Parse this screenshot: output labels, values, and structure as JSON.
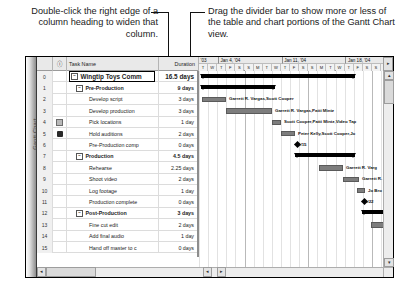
{
  "callouts": {
    "left": "Double-click the right edge of a column heading to widen that column.",
    "right": "Drag the divider bar to show more or less of the table and chart portions of the Gantt Chart view."
  },
  "view": {
    "name": "Gantt Chart"
  },
  "table": {
    "headers": {
      "id": "",
      "indicator": "ⓘ",
      "task_name": "Task Name",
      "duration": "Duration"
    },
    "rows": [
      {
        "id": "0",
        "indicator": "",
        "name": "Wingtip Toys Comm",
        "duration": "16.5 days",
        "level": 0,
        "expander": "−",
        "selected": true
      },
      {
        "id": "1",
        "indicator": "",
        "name": "Pre-Production",
        "duration": "9 days",
        "level": 1,
        "expander": "−",
        "selected": false
      },
      {
        "id": "2",
        "indicator": "",
        "name": "Develop script",
        "duration": "3 days",
        "level": 2,
        "expander": "",
        "selected": false
      },
      {
        "id": "3",
        "indicator": "",
        "name": "Develop production ",
        "duration": "3 days",
        "level": 2,
        "expander": "",
        "selected": false
      },
      {
        "id": "4",
        "indicator": "note-icon",
        "name": "Pick locations",
        "duration": "1 day",
        "level": 2,
        "expander": "",
        "selected": false
      },
      {
        "id": "5",
        "indicator": "hand-icon",
        "name": "Hold auditions",
        "duration": "2 days",
        "level": 2,
        "expander": "",
        "selected": false
      },
      {
        "id": "6",
        "indicator": "",
        "name": "Pre-Production comp",
        "duration": "0 days",
        "level": 2,
        "expander": "",
        "selected": false
      },
      {
        "id": "7",
        "indicator": "",
        "name": "Production",
        "duration": "4.5 days",
        "level": 1,
        "expander": "−",
        "selected": false
      },
      {
        "id": "8",
        "indicator": "",
        "name": "Rehearse",
        "duration": "2.25 days",
        "level": 2,
        "expander": "",
        "selected": false
      },
      {
        "id": "9",
        "indicator": "",
        "name": "Shoot video",
        "duration": "2 days",
        "level": 2,
        "expander": "",
        "selected": false
      },
      {
        "id": "10",
        "indicator": "",
        "name": "Log footage",
        "duration": "1 day",
        "level": 2,
        "expander": "",
        "selected": false
      },
      {
        "id": "11",
        "indicator": "",
        "name": "Production complete",
        "duration": "0 days",
        "level": 2,
        "expander": "",
        "selected": false
      },
      {
        "id": "12",
        "indicator": "",
        "name": "Post-Production",
        "duration": "3 days",
        "level": 1,
        "expander": "−",
        "selected": false
      },
      {
        "id": "13",
        "indicator": "",
        "name": "Fine cut edit",
        "duration": "2 days",
        "level": 2,
        "expander": "",
        "selected": false
      },
      {
        "id": "14",
        "indicator": "",
        "name": "Add final audio",
        "duration": "1 day",
        "level": 2,
        "expander": "",
        "selected": false
      },
      {
        "id": "15",
        "indicator": "",
        "name": "Hand off master to c",
        "duration": "0 days",
        "level": 2,
        "expander": "",
        "selected": false
      }
    ]
  },
  "timeline": {
    "weeks": [
      {
        "label": "'03",
        "left": 0,
        "width": 20
      },
      {
        "label": "Jan 4, '04",
        "left": 20,
        "width": 63.7
      },
      {
        "label": "Jan 11, '04",
        "left": 83.7,
        "width": 63.7
      },
      {
        "label": "Jan 18, '04",
        "left": 147.4,
        "width": 63.7
      }
    ],
    "day_labels": [
      "T",
      "W",
      "T",
      "F",
      "S",
      "S",
      "M",
      "T",
      "W",
      "T",
      "F",
      "S",
      "S",
      "M",
      "T",
      "W",
      "T",
      "F",
      "S",
      "S",
      "M",
      "T",
      "W",
      "T",
      "F",
      "S"
    ],
    "scroll_right_icon": "▸"
  },
  "chart_data": {
    "type": "bar",
    "title": "Gantt Chart",
    "bars": [
      {
        "row": 0,
        "kind": "summary",
        "left": 2,
        "width": 154,
        "label": ""
      },
      {
        "row": 1,
        "kind": "summary",
        "left": 2,
        "width": 74,
        "label": ""
      },
      {
        "row": 2,
        "kind": "task",
        "left": 3,
        "width": 24,
        "label": "Garrett R. Vargas,Scott Cooper"
      },
      {
        "row": 3,
        "kind": "task",
        "left": 27,
        "width": 46,
        "label": "Garrett R. Vargas,Patti Mintz"
      },
      {
        "row": 4,
        "kind": "task",
        "left": 73,
        "width": 9,
        "label": "Scott Cooper,Patti Mintz,Video Tap"
      },
      {
        "row": 5,
        "kind": "task",
        "left": 82,
        "width": 14,
        "label": "Peter Kelly,Scott Cooper,Jo"
      },
      {
        "row": 6,
        "kind": "milestone",
        "left": 96,
        "width": 0,
        "label": "1/15"
      },
      {
        "row": 7,
        "kind": "summary",
        "left": 96,
        "width": 60,
        "label": ""
      },
      {
        "row": 8,
        "kind": "task",
        "left": 120,
        "width": 24,
        "label": "Garrett R. Varg"
      },
      {
        "row": 9,
        "kind": "task",
        "left": 144,
        "width": 16,
        "label": "Garrett R."
      },
      {
        "row": 10,
        "kind": "task",
        "left": 158,
        "width": 8,
        "label": "Jo Bro"
      },
      {
        "row": 11,
        "kind": "milestone",
        "left": 163,
        "width": 0,
        "label": "1/22"
      },
      {
        "row": 12,
        "kind": "summary",
        "left": 163,
        "width": 40,
        "label": ""
      },
      {
        "row": 13,
        "kind": "task",
        "left": 172,
        "width": 24,
        "label": ""
      }
    ],
    "xlabel": "",
    "ylabel": "",
    "grid": true
  },
  "scrollbars": {
    "up": "▴",
    "down": "▾",
    "left": "◂",
    "right": "▸"
  }
}
